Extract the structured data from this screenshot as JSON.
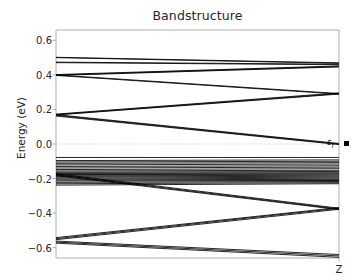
{
  "figure": {
    "title": "Bandstructure",
    "background_color": "#ffffff",
    "axes_color": "#b0b0b0",
    "line_color": "#000000",
    "fermi_label": "ε",
    "fermi_label_sub": "f",
    "fermi_marker": "filled-square"
  },
  "axes_geometry": {
    "left": 56,
    "right": 339,
    "top": 30,
    "bottom": 258
  },
  "chart_data": {
    "type": "line",
    "title": "Bandstructure",
    "xlabel": "",
    "ylabel": "Energy (eV)",
    "xlim": [
      0,
      1
    ],
    "ylim": [
      -0.66,
      0.66
    ],
    "grid": false,
    "legend": null,
    "x_tick_positions": [
      1.0
    ],
    "x_tick_labels": [
      "Z"
    ],
    "y_tick_positions": [
      0.6,
      0.4,
      0.2,
      0.0,
      -0.2,
      -0.4,
      -0.6
    ],
    "y_tick_labels": [
      "0.6",
      "0.4",
      "0.2",
      "0.0",
      "-0.2",
      "-0.4",
      "-0.6"
    ],
    "fermi_level": 0.0,
    "fermi_line_style": "dotted",
    "x": [
      0.0,
      1.0
    ],
    "series": [
      {
        "name": "band-1",
        "values": [
          0.502,
          0.47
        ]
      },
      {
        "name": "band-2",
        "values": [
          0.5,
          0.467
        ]
      },
      {
        "name": "band-3",
        "values": [
          0.474,
          0.462
        ]
      },
      {
        "name": "band-4",
        "values": [
          0.471,
          0.459
        ]
      },
      {
        "name": "band-5",
        "values": [
          0.402,
          0.452
        ]
      },
      {
        "name": "band-6",
        "values": [
          0.399,
          0.449
        ]
      },
      {
        "name": "band-7",
        "values": [
          0.397,
          0.446
        ]
      },
      {
        "name": "band-8",
        "values": [
          0.4,
          0.292
        ]
      },
      {
        "name": "band-9",
        "values": [
          0.397,
          0.289
        ]
      },
      {
        "name": "band-10",
        "values": [
          0.173,
          0.296
        ]
      },
      {
        "name": "band-11",
        "values": [
          0.17,
          0.292
        ]
      },
      {
        "name": "band-12",
        "values": [
          0.168,
          0.289
        ]
      },
      {
        "name": "band-13",
        "values": [
          0.17,
          0.003
        ]
      },
      {
        "name": "band-14",
        "values": [
          0.166,
          0.0
        ]
      },
      {
        "name": "band-15",
        "values": [
          0.162,
          -0.003
        ]
      },
      {
        "name": "band-16",
        "values": [
          -0.078,
          -0.078
        ]
      },
      {
        "name": "band-17",
        "values": [
          -0.096,
          -0.092
        ]
      },
      {
        "name": "band-18",
        "values": [
          -0.104,
          -0.1
        ]
      },
      {
        "name": "band-19",
        "values": [
          -0.112,
          -0.108
        ]
      },
      {
        "name": "band-20",
        "values": [
          -0.121,
          -0.116
        ]
      },
      {
        "name": "band-21",
        "values": [
          -0.13,
          -0.126
        ]
      },
      {
        "name": "band-22",
        "values": [
          -0.139,
          -0.134
        ]
      },
      {
        "name": "band-23",
        "values": [
          -0.148,
          -0.143
        ]
      },
      {
        "name": "band-24",
        "values": [
          -0.156,
          -0.152
        ]
      },
      {
        "name": "band-25",
        "values": [
          -0.163,
          -0.159
        ]
      },
      {
        "name": "band-26",
        "values": [
          -0.168,
          -0.166
        ]
      },
      {
        "name": "band-27",
        "values": [
          -0.172,
          -0.172
        ]
      },
      {
        "name": "band-28",
        "values": [
          -0.176,
          -0.178
        ]
      },
      {
        "name": "band-29",
        "values": [
          -0.18,
          -0.184
        ]
      },
      {
        "name": "band-30",
        "values": [
          -0.185,
          -0.19
        ]
      },
      {
        "name": "band-31",
        "values": [
          -0.19,
          -0.196
        ]
      },
      {
        "name": "band-32",
        "values": [
          -0.196,
          -0.202
        ]
      },
      {
        "name": "band-33",
        "values": [
          -0.202,
          -0.207
        ]
      },
      {
        "name": "band-34",
        "values": [
          -0.208,
          -0.211
        ]
      },
      {
        "name": "band-35",
        "values": [
          -0.214,
          -0.214
        ]
      },
      {
        "name": "band-36",
        "values": [
          -0.222,
          -0.218
        ]
      },
      {
        "name": "band-37",
        "values": [
          -0.23,
          -0.224
        ]
      },
      {
        "name": "band-38",
        "values": [
          -0.238,
          -0.23
        ]
      },
      {
        "name": "band-39",
        "values": [
          -0.172,
          -0.372
        ]
      },
      {
        "name": "band-40",
        "values": [
          -0.178,
          -0.376
        ]
      },
      {
        "name": "band-41",
        "values": [
          -0.183,
          -0.38
        ]
      },
      {
        "name": "band-42",
        "values": [
          -0.542,
          -0.368
        ]
      },
      {
        "name": "band-43",
        "values": [
          -0.548,
          -0.372
        ]
      },
      {
        "name": "band-44",
        "values": [
          -0.554,
          -0.378
        ]
      },
      {
        "name": "band-45",
        "values": [
          -0.562,
          -0.64
        ]
      },
      {
        "name": "band-46",
        "values": [
          -0.568,
          -0.648
        ]
      },
      {
        "name": "band-47",
        "values": [
          -0.574,
          -0.656
        ]
      }
    ]
  }
}
